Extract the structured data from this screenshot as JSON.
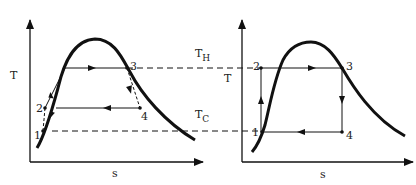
{
  "left_diagram": {
    "y_axis_label": "T",
    "x_axis_label": "s",
    "points": {
      "p1": "1",
      "p2": "2",
      "p3": "3",
      "p4": "4"
    }
  },
  "right_diagram": {
    "y_axis_label": "T",
    "x_axis_label": "s",
    "points": {
      "p1": "1",
      "p2": "2",
      "p3": "3",
      "p4": "4"
    }
  },
  "reference_lines": {
    "hot": {
      "main": "T",
      "sub": "H"
    },
    "cold": {
      "main": "T",
      "sub": "C"
    }
  },
  "colors": {
    "stroke": "#111111",
    "background": "#ffffff"
  }
}
